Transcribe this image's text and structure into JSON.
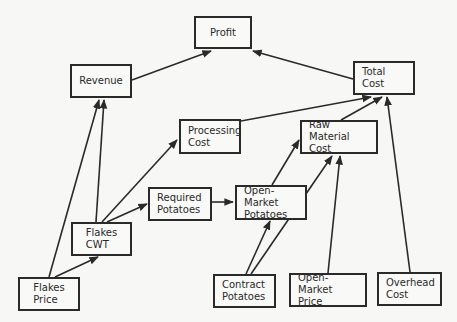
{
  "diagram": {
    "type": "influence-diagram",
    "nodes": [
      {
        "id": "profit",
        "label": "Profit",
        "x": 194,
        "y": 16,
        "w": 58,
        "h": 33,
        "align": "center"
      },
      {
        "id": "revenue",
        "label": "Revenue",
        "x": 70,
        "y": 64,
        "w": 62,
        "h": 34,
        "align": "center"
      },
      {
        "id": "total_cost",
        "label": "Total Cost",
        "x": 353,
        "y": 61,
        "w": 62,
        "h": 34,
        "align": "center"
      },
      {
        "id": "processing_cost",
        "label": "Processing\nCost",
        "x": 179,
        "y": 119,
        "w": 62,
        "h": 35,
        "align": "left"
      },
      {
        "id": "raw_material_cost",
        "label": "Raw Material\nCost",
        "x": 300,
        "y": 120,
        "w": 78,
        "h": 34,
        "align": "left"
      },
      {
        "id": "required_potatoes",
        "label": "Required\nPotatoes",
        "x": 148,
        "y": 187,
        "w": 64,
        "h": 34,
        "align": "left"
      },
      {
        "id": "open_market_potatoes",
        "label": "Open-Market\nPotatoes",
        "x": 235,
        "y": 185,
        "w": 72,
        "h": 35,
        "align": "left"
      },
      {
        "id": "flakes_cwt",
        "label": "Flakes\nCWT",
        "x": 71,
        "y": 222,
        "w": 61,
        "h": 34,
        "align": "center"
      },
      {
        "id": "flakes_price",
        "label": "Flakes\nPrice",
        "x": 18,
        "y": 277,
        "w": 62,
        "h": 34,
        "align": "center"
      },
      {
        "id": "contract_potatoes",
        "label": "Contract\nPotatoes",
        "x": 213,
        "y": 274,
        "w": 63,
        "h": 34,
        "align": "left"
      },
      {
        "id": "open_market_price",
        "label": "Open-Market\nPrice",
        "x": 289,
        "y": 273,
        "w": 78,
        "h": 34,
        "align": "left"
      },
      {
        "id": "overhead_cost",
        "label": "Overhead\nCost",
        "x": 377,
        "y": 272,
        "w": 65,
        "h": 34,
        "align": "left"
      }
    ],
    "edges": [
      {
        "from": "revenue",
        "to": "profit",
        "x1": 132,
        "y1": 80,
        "x2": 211,
        "y2": 51
      },
      {
        "from": "total_cost",
        "to": "profit",
        "x1": 353,
        "y1": 79,
        "x2": 253,
        "y2": 51
      },
      {
        "from": "processing_cost",
        "to": "total_cost",
        "x1": 241,
        "y1": 121,
        "x2": 371,
        "y2": 97
      },
      {
        "from": "raw_material_cost",
        "to": "total_cost",
        "x1": 341,
        "y1": 120,
        "x2": 382,
        "y2": 97
      },
      {
        "from": "overhead_cost",
        "to": "total_cost",
        "x1": 410,
        "y1": 272,
        "x2": 387,
        "y2": 97
      },
      {
        "from": "flakes_price",
        "to": "revenue",
        "x1": 49,
        "y1": 277,
        "x2": 99,
        "y2": 100
      },
      {
        "from": "flakes_cwt",
        "to": "revenue",
        "x1": 96,
        "y1": 222,
        "x2": 104,
        "y2": 100
      },
      {
        "from": "flakes_price",
        "to": "flakes_cwt",
        "x1": 55,
        "y1": 277,
        "x2": 98,
        "y2": 257
      },
      {
        "from": "flakes_cwt",
        "to": "processing_cost",
        "x1": 102,
        "y1": 222,
        "x2": 177,
        "y2": 140
      },
      {
        "from": "flakes_cwt",
        "to": "required_potatoes",
        "x1": 107,
        "y1": 222,
        "x2": 147,
        "y2": 204
      },
      {
        "from": "required_potatoes",
        "to": "open_market_potatoes",
        "x1": 212,
        "y1": 202,
        "x2": 233,
        "y2": 202
      },
      {
        "from": "open_market_potatoes",
        "to": "raw_material_cost",
        "x1": 272,
        "y1": 185,
        "x2": 299,
        "y2": 140
      },
      {
        "from": "contract_potatoes",
        "to": "open_market_potatoes",
        "x1": 246,
        "y1": 274,
        "x2": 270,
        "y2": 221
      },
      {
        "from": "contract_potatoes",
        "to": "raw_material_cost",
        "x1": 251,
        "y1": 274,
        "x2": 332,
        "y2": 156
      },
      {
        "from": "open_market_price",
        "to": "raw_material_cost",
        "x1": 328,
        "y1": 273,
        "x2": 340,
        "y2": 156
      }
    ],
    "colors": {
      "line": "#2a2a2a",
      "background": "#f7f7f5",
      "box_fill": "#f9f9f7"
    }
  }
}
